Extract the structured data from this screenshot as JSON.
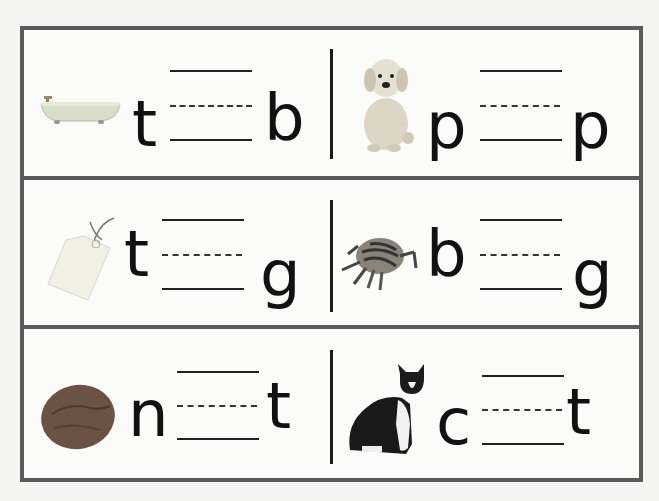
{
  "worksheet": {
    "rows": [
      {
        "left": {
          "picture": "bathtub",
          "first_letter": "t",
          "last_letter": "b"
        },
        "right": {
          "picture": "puppy",
          "first_letter": "p",
          "last_letter": "p"
        }
      },
      {
        "left": {
          "picture": "tag",
          "first_letter": "t",
          "last_letter": "g"
        },
        "right": {
          "picture": "bug",
          "first_letter": "b",
          "last_letter": "g"
        }
      },
      {
        "left": {
          "picture": "nut",
          "first_letter": "n",
          "last_letter": "t"
        },
        "right": {
          "picture": "cat",
          "first_letter": "c",
          "last_letter": "t"
        }
      }
    ]
  },
  "colors": {
    "border": "#5a5a5a",
    "ink": "#111111",
    "paper": "#fbfbfa"
  }
}
